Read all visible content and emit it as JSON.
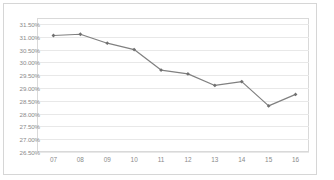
{
  "chart_data": {
    "type": "line",
    "title": "",
    "subtitle": "",
    "xlabel": "",
    "ylabel": "",
    "categories": [
      "07",
      "08",
      "09",
      "10",
      "11",
      "12",
      "13",
      "14",
      "15",
      "16"
    ],
    "series": [
      {
        "name": "series-1",
        "values": [
          31.05,
          31.1,
          30.75,
          30.5,
          29.7,
          29.55,
          29.1,
          29.25,
          28.3,
          28.75
        ],
        "color": "#808080",
        "marker": "diamond"
      }
    ],
    "ylim": [
      26.5,
      31.5
    ],
    "ytick_values": [
      31.5,
      31.0,
      30.5,
      30.0,
      29.5,
      29.0,
      28.5,
      28.0,
      27.5,
      27.0,
      26.5
    ],
    "ytick_labels": [
      "31.50%",
      "31.00%",
      "30.50%",
      "30.00%",
      "29.50%",
      "29.00%",
      "28.50%",
      "28.00%",
      "27.50%",
      "27.00%",
      "26.50%"
    ],
    "value_format": "percent",
    "grid": true,
    "grid_axis": "y",
    "legend": false,
    "legend_position": "none",
    "annotations": [],
    "colors": {
      "line": "#808080",
      "marker": "#707070",
      "gridline": "#e8e8e8",
      "plot_border": "#d9d9d9",
      "chart_border": "#d6d6d6",
      "tick_label": "#8a8a8a",
      "background": "#ffffff"
    }
  }
}
